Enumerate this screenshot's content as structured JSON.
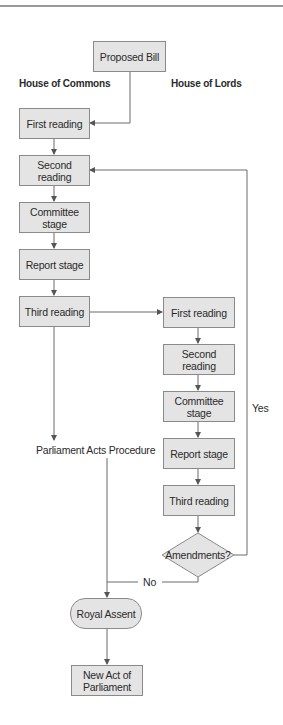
{
  "diagram": {
    "type": "flowchart",
    "start": {
      "label": "Proposed Bill"
    },
    "columns": {
      "commons": {
        "heading": "House of Commons",
        "steps": [
          "First reading",
          "Second reading",
          "Committee stage",
          "Report stage",
          "Third reading"
        ]
      },
      "lords": {
        "heading": "House of Lords",
        "steps": [
          "First reading",
          "Second reading",
          "Committee stage",
          "Report stage",
          "Third reading"
        ]
      }
    },
    "decision": {
      "label": "Amendments?",
      "yes_label": "Yes",
      "no_label": "No"
    },
    "bypass": {
      "label": "Parliament Acts Procedure"
    },
    "royal_assent": {
      "label": "Royal Assent"
    },
    "end": {
      "line1": "New Act of",
      "line2": "Parliament"
    },
    "colors": {
      "box_fill": "#e4e4e4",
      "box_border": "#8a8a8a",
      "line": "#6a6a6a"
    }
  }
}
